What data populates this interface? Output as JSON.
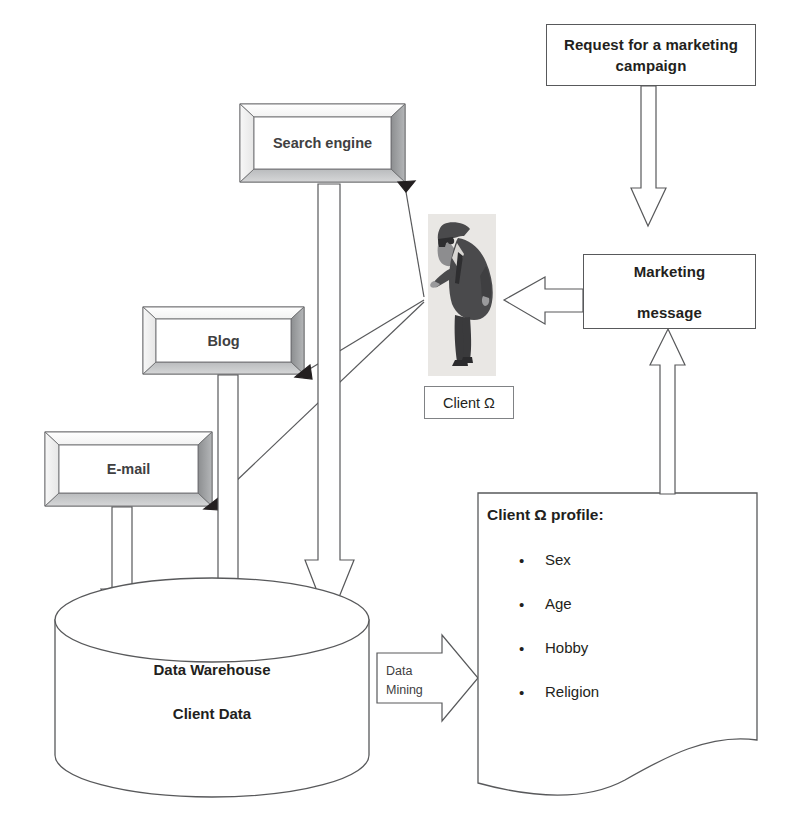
{
  "diagram": {
    "title_nodes": {
      "request": {
        "line1": "Request for a marketing",
        "line2": "campaign"
      },
      "marketing": {
        "line1": "Marketing",
        "line2": "message"
      }
    },
    "channels": [
      {
        "id": "search-engine",
        "label": "Search engine"
      },
      {
        "id": "blog",
        "label": "Blog"
      },
      {
        "id": "email",
        "label": "E-mail"
      }
    ],
    "client": {
      "label": "Client Ω",
      "figure_alt": "businessman-clipart"
    },
    "warehouse": {
      "line1": "Data Warehouse",
      "line2": "Client Data"
    },
    "process_arrow": {
      "line1": "Data",
      "line2": "Mining"
    },
    "profile": {
      "title": "Client Ω profile:",
      "bullet_glyph": "•",
      "items": [
        "Sex",
        "Age",
        "Hobby",
        "Religion"
      ]
    },
    "colors": {
      "outline": "#58595b",
      "bevel_light": "#ffffff",
      "bevel_shadow": "#808285",
      "bevel_dark": "#6d6e71",
      "text": "#231f20",
      "figure_bg": "#e9e7e4",
      "page_bg": "#ffffff"
    }
  }
}
